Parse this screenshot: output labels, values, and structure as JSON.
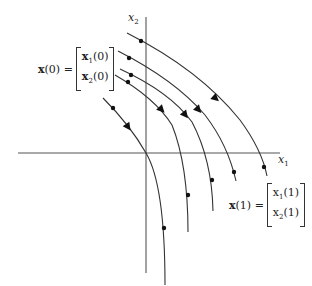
{
  "diagram": {
    "type": "phase-portrait",
    "axes": {
      "x_label": {
        "base": "x",
        "sub": "1"
      },
      "y_label": {
        "base": "x",
        "sub": "2"
      }
    },
    "initial_state_label": {
      "lhs": "x",
      "lhs_arg": "(0) =",
      "entries": [
        {
          "base": "x",
          "sub": "1",
          "arg": "(0)"
        },
        {
          "base": "x",
          "sub": "2",
          "arg": "(0)"
        }
      ]
    },
    "next_state_label": {
      "lhs": "x",
      "lhs_arg": "(1) =",
      "entries": [
        {
          "base": "x",
          "sub": "1",
          "arg": "(1)"
        },
        {
          "base": "x",
          "sub": "2",
          "arg": "(1)"
        }
      ]
    },
    "trajectory_count": 5,
    "colors": {
      "stroke": "#333333",
      "background": "#ffffff"
    }
  }
}
